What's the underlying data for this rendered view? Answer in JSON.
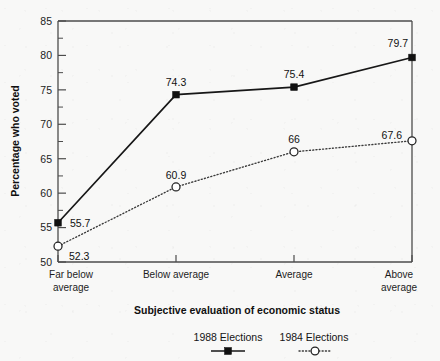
{
  "chart_data": {
    "type": "line",
    "title": "",
    "xlabel": "Subjective evaluation of economic status",
    "ylabel": "Percentage who voted",
    "categories": [
      "Far below average",
      "Below average",
      "Average",
      "Above average"
    ],
    "category_lines": [
      [
        "Far below",
        "average"
      ],
      [
        "Below average",
        ""
      ],
      [
        "Average",
        ""
      ],
      [
        "Above",
        "average"
      ]
    ],
    "ylim": [
      50,
      85
    ],
    "yticks": [
      50,
      55,
      60,
      65,
      70,
      75,
      80,
      85
    ],
    "ytick_labels": [
      "50",
      "55",
      "60",
      "65",
      "70",
      "75",
      "80",
      "85"
    ],
    "yminor_step": 2.5,
    "grid": false,
    "legend_position": "bottom",
    "series": [
      {
        "name": "1988 Elections",
        "values": [
          55.7,
          74.3,
          75.4,
          79.7
        ],
        "value_labels": [
          "55.7",
          "74.3",
          "75.4",
          "79.7"
        ],
        "marker": "filled-square",
        "line_style": "solid",
        "color": "#171717"
      },
      {
        "name": "1984 Elections",
        "values": [
          52.3,
          60.9,
          66,
          67.6
        ],
        "value_labels": [
          "52.3",
          "60.9",
          "66",
          "67.6"
        ],
        "marker": "open-circle",
        "line_style": "dotted",
        "color": "#3a3a3a"
      }
    ]
  },
  "axis": {
    "y_title": "Percentage who voted",
    "x_title": "Subjective evaluation of economic status"
  },
  "legend": {
    "items": [
      {
        "label": "1988 Elections"
      },
      {
        "label": "1984 Elections"
      }
    ]
  }
}
